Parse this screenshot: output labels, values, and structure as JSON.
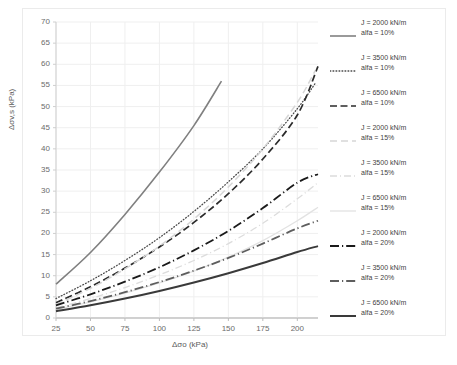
{
  "chart_data": {
    "type": "line",
    "title": "",
    "xlabel": "Δσo (kPa)",
    "ylabel": "Δσv,s (kPa)",
    "xlim": [
      25,
      215
    ],
    "ylim": [
      0,
      70
    ],
    "xticks": [
      25,
      50,
      75,
      100,
      125,
      150,
      175,
      200
    ],
    "yticks": [
      0,
      5,
      10,
      15,
      20,
      25,
      30,
      35,
      40,
      45,
      50,
      55,
      60,
      65,
      70
    ],
    "grid": true,
    "legend_position": "right",
    "x": [
      25,
      50,
      75,
      100,
      125,
      150,
      175,
      200,
      215
    ],
    "series": [
      {
        "name": "J = 2000 kN/m alfa = 10%",
        "J": "2000 kN/m",
        "alfa": "10%",
        "style": "solid",
        "color": "#808080",
        "width": 1.6,
        "x": [
          25,
          50,
          75,
          100,
          125,
          145
        ],
        "values": [
          8.0,
          15.5,
          24.5,
          34.5,
          45.5,
          56.0
        ]
      },
      {
        "name": "J = 3500 kN/m alfa = 10%",
        "J": "3500 kN/m",
        "alfa": "10%",
        "style": "dotted",
        "color": "#4a4a4a",
        "width": 1.3,
        "x": [
          25,
          50,
          75,
          100,
          125,
          150,
          175,
          200,
          213
        ],
        "values": [
          4.6,
          8.8,
          13.6,
          19.0,
          25.2,
          32.2,
          40.0,
          49.5,
          55.5
        ]
      },
      {
        "name": "J = 6500 kN/m alfa = 10%",
        "J": "6500 kN/m",
        "alfa": "10%",
        "style": "dashed",
        "color": "#2b2b2b",
        "width": 1.7,
        "x": [
          25,
          50,
          75,
          100,
          125,
          150,
          175,
          200,
          215
        ],
        "values": [
          3.6,
          7.4,
          11.8,
          16.8,
          22.6,
          29.4,
          37.6,
          48.0,
          59.5
        ]
      },
      {
        "name": "J = 2000 kN/m alfa = 15%",
        "J": "2000 kN/m",
        "alfa": "15%",
        "style": "dashed-light",
        "color": "#d6d6d6",
        "width": 1.5,
        "x": [
          25,
          50,
          75,
          100,
          125,
          150,
          175,
          200,
          213
        ],
        "values": [
          3.2,
          7.0,
          11.6,
          17.0,
          23.4,
          31.0,
          40.0,
          51.0,
          58.5
        ]
      },
      {
        "name": "J = 3500 kN/m alfa = 15%",
        "J": "3500 kN/m",
        "alfa": "15%",
        "style": "dashdot-light",
        "color": "#dcdcdc",
        "width": 1.3,
        "x": [
          25,
          50,
          75,
          100,
          125,
          150,
          175,
          200,
          215
        ],
        "values": [
          2.4,
          4.6,
          7.2,
          10.2,
          13.6,
          17.6,
          22.4,
          28.2,
          32.0
        ]
      },
      {
        "name": "J = 6500 kN/m alfa = 15%",
        "J": "6500 kN/m",
        "alfa": "15%",
        "style": "solid-light",
        "color": "#e2e2e2",
        "width": 1.3,
        "x": [
          25,
          50,
          75,
          100,
          125,
          150,
          175,
          200,
          215
        ],
        "values": [
          2.0,
          3.8,
          5.9,
          8.3,
          11.1,
          14.4,
          18.3,
          23.0,
          26.2
        ]
      },
      {
        "name": "J = 2000 kN/m alfa = 20%",
        "J": "2000 kN/m",
        "alfa": "20%",
        "style": "dashdot-dark",
        "color": "#1a1a1a",
        "width": 1.8,
        "x": [
          25,
          50,
          75,
          100,
          125,
          150,
          175,
          200,
          215
        ],
        "values": [
          3.0,
          5.6,
          8.6,
          12.0,
          16.0,
          20.6,
          26.0,
          32.0,
          34.0
        ]
      },
      {
        "name": "J = 3500 kN/m alfa = 20%",
        "J": "3500 kN/m",
        "alfa": "20%",
        "style": "dashdot-gray",
        "color": "#5e5e5e",
        "width": 1.8,
        "x": [
          25,
          50,
          75,
          100,
          125,
          150,
          175,
          200,
          215
        ],
        "values": [
          2.2,
          4.0,
          6.1,
          8.5,
          11.2,
          14.2,
          17.6,
          21.2,
          23.0
        ]
      },
      {
        "name": "J = 6500 kN/m alfa = 20%",
        "J": "6500 kN/m",
        "alfa": "20%",
        "style": "solid-dark",
        "color": "#3a3a3a",
        "width": 2.0,
        "x": [
          25,
          50,
          75,
          100,
          125,
          150,
          175,
          200,
          215
        ],
        "values": [
          1.6,
          3.0,
          4.6,
          6.4,
          8.4,
          10.6,
          13.0,
          15.6,
          17.0
        ]
      }
    ]
  },
  "legend": {
    "items": [
      {
        "line1": "J = 2000 kN/m",
        "line2": "alfa = 10%"
      },
      {
        "line1": "J = 3500 kN/m",
        "line2": "alfa = 10%"
      },
      {
        "line1": "J = 6500 kN/m",
        "line2": "alfa = 10%"
      },
      {
        "line1": "J = 2000 kN/m",
        "line2": "alfa = 15%"
      },
      {
        "line1": "J = 3500 kN/m",
        "line2": "alfa = 15%"
      },
      {
        "line1": "J = 6500 kN/m",
        "line2": "alfa = 15%"
      },
      {
        "line1": "J = 2000 kN/m",
        "line2": "alfa = 20%"
      },
      {
        "line1": "J = 3500 kN/m",
        "line2": "alfa = 20%"
      },
      {
        "line1": "J = 6500 kN/m",
        "line2": "alfa = 20%"
      }
    ]
  }
}
